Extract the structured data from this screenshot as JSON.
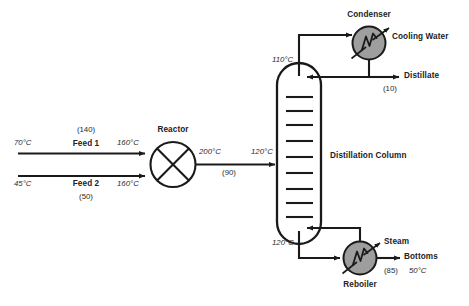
{
  "diagram": {
    "background_color": "#ffffff",
    "line_color": "#1a1a1a",
    "equipment_fill": "#9e9e9e",
    "vessel_fill": "#ffffff"
  },
  "equipment": {
    "reactor": {
      "label": "Reactor",
      "shape": "circle-with-x",
      "fill": "#ffffff"
    },
    "column": {
      "label": "Distillation Column",
      "shape": "vertical-vessel",
      "trays": 9,
      "fill": "#ffffff"
    },
    "condenser": {
      "label": "Condenser",
      "shape": "circle-heat-exchanger",
      "fill": "#9e9e9e"
    },
    "reboiler": {
      "label": "Reboiler",
      "shape": "circle-heat-exchanger",
      "fill": "#9e9e9e"
    }
  },
  "streams": {
    "feed1": {
      "label": "Feed 1",
      "inlet_temp": "70°C",
      "outlet_temp": "160°C",
      "rate": "(140)"
    },
    "feed2": {
      "label": "Feed 2",
      "inlet_temp": "45°C",
      "outlet_temp": "160°C",
      "rate": "(50)"
    },
    "reactor_outlet": {
      "outlet_temp": "200°C",
      "column_inlet_temp": "120°C",
      "rate": "(90)"
    },
    "column_top": {
      "temp": "110°C"
    },
    "column_bottom": {
      "temp": "120°C"
    },
    "distillate": {
      "label": "Distillate",
      "rate": "(10)"
    },
    "bottoms": {
      "label": "Bottoms",
      "rate": "(85)",
      "temp": "50°C"
    },
    "cooling_water": {
      "label": "Cooling Water"
    },
    "steam": {
      "label": "Steam"
    }
  }
}
